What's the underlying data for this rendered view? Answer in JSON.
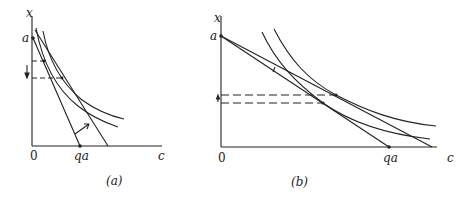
{
  "panels": [
    {
      "caption": "(a)",
      "y_axis_label": "x",
      "x_axis_label": "c",
      "origin_label": "0",
      "y_intercept_label": "a",
      "x_intercept_label": "qa",
      "arrow_direction": "down"
    },
    {
      "caption": "(b)",
      "y_axis_label": "x",
      "x_axis_label": "c",
      "origin_label": "0",
      "y_intercept_label": "a",
      "x_intercept_label": "qa",
      "arrow_direction": "up"
    }
  ]
}
